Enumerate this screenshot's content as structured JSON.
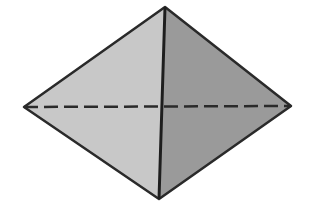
{
  "figure": {
    "vertices": {
      "top": [
        165,
        7
      ],
      "left": [
        24,
        107
      ],
      "right": [
        291,
        106
      ],
      "bottom": [
        159,
        199
      ]
    },
    "colors": {
      "left_face": "#c8c8c8",
      "right_face": "#9a9a9a",
      "edge": "#2a2a2a",
      "background": "#ffffff"
    }
  }
}
